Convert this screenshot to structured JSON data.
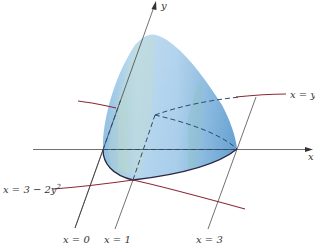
{
  "figure": {
    "colors": {
      "solid_fill": "#9cc6e8",
      "solid_fill_dark": "#6fa8d6",
      "solid_highlight": "#d4e8f5",
      "curve": "#8a2a35",
      "axis": "#333333",
      "dashed": "#2d4a6b"
    },
    "axes": {
      "x_label": "x",
      "y_label": "y"
    },
    "curves": [
      {
        "id": "upper",
        "label": "x = y",
        "sup": "2"
      },
      {
        "id": "lower",
        "label": "x = 3 − 2y",
        "sup": "2"
      }
    ],
    "guide_lines": [
      {
        "label": "x = 0"
      },
      {
        "label": "x = 1"
      },
      {
        "label": "x = 3"
      }
    ]
  }
}
